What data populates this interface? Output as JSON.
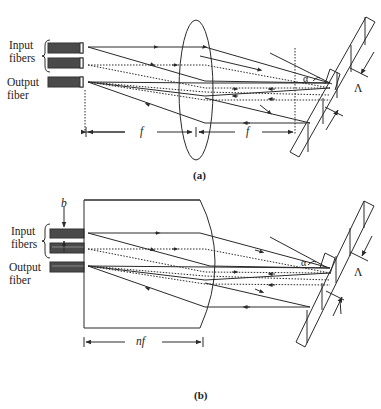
{
  "figure": {
    "panel_a": {
      "caption": "(a)",
      "labels": {
        "input_fibers_line1": "Input",
        "input_fibers_line2": "fibers",
        "output_fiber_line1": "Output",
        "output_fiber_line2": "fiber",
        "focal_left": "f",
        "focal_right": "f",
        "blaze_angle": "α",
        "grating_period": "Λ"
      },
      "components": [
        "input fiber 1",
        "input fiber 2",
        "output fiber",
        "biconvex lens",
        "blazed diffraction grating"
      ]
    },
    "panel_b": {
      "caption": "(b)",
      "labels": {
        "fiber_spacing": "b",
        "input_fibers_line1": "Input",
        "input_fibers_line2": "fibers",
        "output_fiber_line1": "Output",
        "output_fiber_line2": "fiber",
        "length": "nf",
        "blaze_angle": "α",
        "grating_period": "Λ"
      },
      "components": [
        "input fiber 1",
        "input fiber 2",
        "output fiber",
        "GRIN / plano-convex block lens",
        "blazed diffraction grating"
      ]
    },
    "colors": {
      "line": "#2a2a2a",
      "fiber_fill": "#4a4a4a",
      "background": "#ffffff"
    }
  }
}
